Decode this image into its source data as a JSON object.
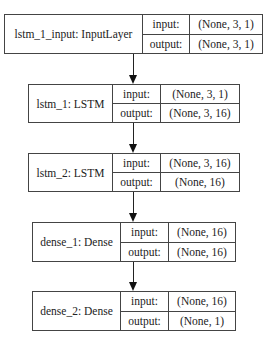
{
  "diagram": {
    "type": "keras-model-plot",
    "nodes": [
      {
        "id": "lstm_1_input",
        "name": "lstm_1_input: InputLayer",
        "input_label": "input:",
        "input_shape": "(None, 3, 1)",
        "output_label": "output:",
        "output_shape": "(None, 3, 1)"
      },
      {
        "id": "lstm_1",
        "name": "lstm_1: LSTM",
        "input_label": "input:",
        "input_shape": "(None, 3, 1)",
        "output_label": "output:",
        "output_shape": "(None, 3, 16)"
      },
      {
        "id": "lstm_2",
        "name": "lstm_2: LSTM",
        "input_label": "input:",
        "input_shape": "(None, 3, 16)",
        "output_label": "output:",
        "output_shape": "(None, 16)"
      },
      {
        "id": "dense_1",
        "name": "dense_1: Dense",
        "input_label": "input:",
        "input_shape": "(None, 16)",
        "output_label": "output:",
        "output_shape": "(None, 16)"
      },
      {
        "id": "dense_2",
        "name": "dense_2: Dense",
        "input_label": "input:",
        "input_shape": "(None, 16)",
        "output_label": "output:",
        "output_shape": "(None, 1)"
      }
    ],
    "edges": [
      {
        "from": "lstm_1_input",
        "to": "lstm_1"
      },
      {
        "from": "lstm_1",
        "to": "lstm_2"
      },
      {
        "from": "lstm_2",
        "to": "dense_1"
      },
      {
        "from": "dense_1",
        "to": "dense_2"
      }
    ],
    "colors": {
      "border": "#444444",
      "text": "#222222",
      "background": "#ffffff"
    }
  }
}
